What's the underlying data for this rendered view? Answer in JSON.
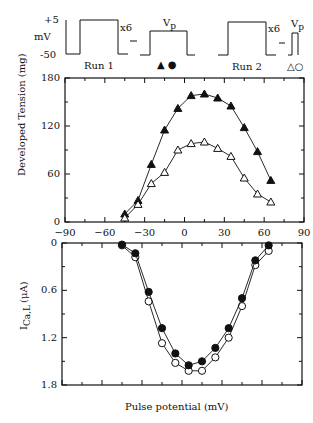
{
  "protocol": {
    "mv_label": "mV",
    "v_high": "+5",
    "v_low": "-50",
    "repeat_label": "x6",
    "vp_label": "V",
    "vp_sub": "p",
    "run1_label": "Run 1",
    "run2_label": "Run 2",
    "run1_symbols": "▲ ●",
    "run2_symbols": "△○"
  },
  "chart_data": [
    {
      "type": "line",
      "title": "",
      "xlabel": "",
      "ylabel": "Developed Tension (mg)",
      "xlim": [
        -90,
        90
      ],
      "ylim": [
        0,
        180
      ],
      "xticks": [
        -90,
        -60,
        -30,
        0,
        30,
        60,
        90
      ],
      "yticks": [
        0,
        60,
        120,
        180
      ],
      "x": [
        -45,
        -35,
        -25,
        -15,
        -5,
        5,
        15,
        25,
        35,
        45,
        55,
        65
      ],
      "series": [
        {
          "name": "Run 1 (filled triangles)",
          "marker": "filled-triangle",
          "values": [
            10,
            27,
            72,
            115,
            142,
            158,
            160,
            155,
            145,
            118,
            88,
            52
          ]
        },
        {
          "name": "Run 2 (open triangles)",
          "marker": "open-triangle",
          "values": [
            5,
            22,
            48,
            62,
            90,
            98,
            100,
            92,
            82,
            55,
            35,
            25
          ]
        }
      ]
    },
    {
      "type": "line",
      "title": "",
      "xlabel": "Pulse potential (mV)",
      "ylabel": "I Ca,L (μA)",
      "xlim": [
        -90,
        90
      ],
      "ylim": [
        0,
        1.8
      ],
      "y_inverted": true,
      "yticks": [
        0,
        0.6,
        1.2,
        1.8
      ],
      "x": [
        -45,
        -35,
        -25,
        -15,
        -5,
        5,
        15,
        25,
        35,
        45,
        55,
        65
      ],
      "series": [
        {
          "name": "Run 1 (filled circles)",
          "marker": "filled-circle",
          "values": [
            0.02,
            0.13,
            0.62,
            1.08,
            1.4,
            1.55,
            1.5,
            1.33,
            1.08,
            0.7,
            0.22,
            0.03
          ]
        },
        {
          "name": "Run 2 (open circles)",
          "marker": "open-circle",
          "values": [
            0.03,
            0.18,
            0.74,
            1.27,
            1.52,
            1.62,
            1.62,
            1.45,
            1.2,
            0.8,
            0.28,
            0.1
          ]
        }
      ]
    }
  ],
  "labels": {
    "top_ylabel": "Developed Tension (mg)",
    "bottom_ylabel_main": "I",
    "bottom_ylabel_sub": "Ca,L",
    "bottom_ylabel_unit": "(μA)",
    "xlabel": "Pulse potential (mV)",
    "top_yticks": [
      "180",
      "120",
      "60",
      "0"
    ],
    "xticks": [
      "-90",
      "-60",
      "-30",
      "0",
      "30",
      "60",
      "90"
    ],
    "bottom_yticks": [
      "0",
      "0.6",
      "1.2",
      "1.8"
    ]
  }
}
